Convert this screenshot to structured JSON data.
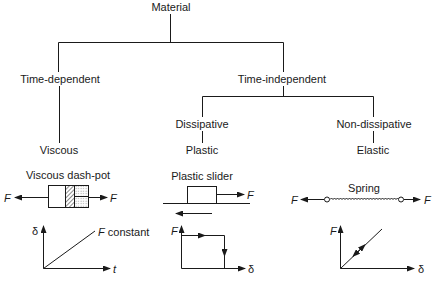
{
  "diagram": {
    "root": {
      "label": "Material"
    },
    "level1": [
      {
        "label": "Time-dependent"
      },
      {
        "label": "Time-independent"
      }
    ],
    "level2": [
      {
        "label": "Dissipative"
      },
      {
        "label": "Non-dissipative"
      }
    ],
    "leaves": [
      {
        "label": "Viscous"
      },
      {
        "label": "Plastic"
      },
      {
        "label": "Elastic"
      }
    ],
    "elements": [
      {
        "title": "Viscous dash-pot",
        "force_left": "F",
        "force_right": "F"
      },
      {
        "title": "Plastic slider",
        "force_right": "F"
      },
      {
        "title": "Spring",
        "force_left": "F",
        "force_right": "F"
      }
    ],
    "graphs": [
      {
        "y_label": "δ",
        "x_label": "t",
        "annotation": "F constant"
      },
      {
        "y_label": "F",
        "x_label": "δ"
      },
      {
        "y_label": "F",
        "x_label": "δ"
      }
    ],
    "colors": {
      "line": "#1a1a1a",
      "background": "#ffffff"
    }
  }
}
